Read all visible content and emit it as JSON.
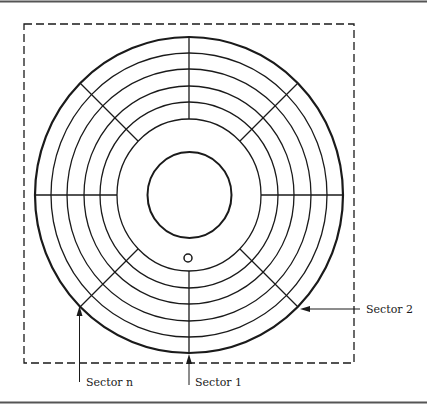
{
  "diagram": {
    "colors": {
      "line": "#1a1a1a",
      "border": "#555555",
      "background": "#ffffff"
    },
    "disk": {
      "center": [
        189,
        195
      ],
      "tracks": 6,
      "track_radii": [
        76,
        93,
        109,
        126,
        142,
        157
      ],
      "hub_radius": 42,
      "index_hole": {
        "center": [
          188,
          258
        ],
        "radius": 4
      }
    },
    "labels": {
      "sector_1": "Sector 1",
      "sector_2": "Sector 2",
      "sector_n": "Sector n"
    }
  }
}
